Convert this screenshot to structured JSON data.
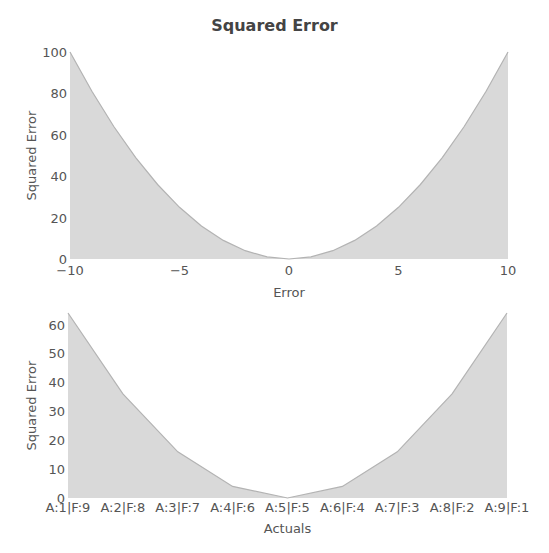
{
  "title": "Squared Error",
  "colors": {
    "fill": "#d9d9d9",
    "line": "#b3b3b3",
    "text": "#555555"
  },
  "chart_data": [
    {
      "type": "area",
      "title": "Squared Error",
      "xlabel": "Error",
      "ylabel": "Squared Error",
      "xlim": [
        -10,
        10
      ],
      "ylim": [
        0,
        100
      ],
      "xticks": [
        "−10",
        "−5",
        "0",
        "5",
        "10"
      ],
      "xtick_values": [
        -10,
        -5,
        0,
        5,
        10
      ],
      "yticks": [
        "0",
        "20",
        "40",
        "60",
        "80",
        "100"
      ],
      "ytick_values": [
        0,
        20,
        40,
        60,
        80,
        100
      ],
      "grid": false,
      "x": [
        -10,
        -9,
        -8,
        -7,
        -6,
        -5,
        -4,
        -3,
        -2,
        -1,
        0,
        1,
        2,
        3,
        4,
        5,
        6,
        7,
        8,
        9,
        10
      ],
      "values": [
        100,
        81,
        64,
        49,
        36,
        25,
        16,
        9,
        4,
        1,
        0,
        1,
        4,
        9,
        16,
        25,
        36,
        49,
        64,
        81,
        100
      ]
    },
    {
      "type": "area",
      "title": "",
      "xlabel": "Actuals",
      "ylabel": "Squared Error",
      "ylim": [
        0,
        64
      ],
      "yticks": [
        "0",
        "10",
        "20",
        "30",
        "40",
        "50",
        "60"
      ],
      "ytick_values": [
        0,
        10,
        20,
        30,
        40,
        50,
        60
      ],
      "grid": false,
      "categories": [
        "A:1|F:9",
        "A:2|F:8",
        "A:3|F:7",
        "A:4|F:6",
        "A:5|F:5",
        "A:6|F:4",
        "A:7|F:3",
        "A:8|F:2",
        "A:9|F:1"
      ],
      "values": [
        64,
        36,
        16,
        4,
        0,
        4,
        16,
        36,
        64
      ]
    }
  ]
}
